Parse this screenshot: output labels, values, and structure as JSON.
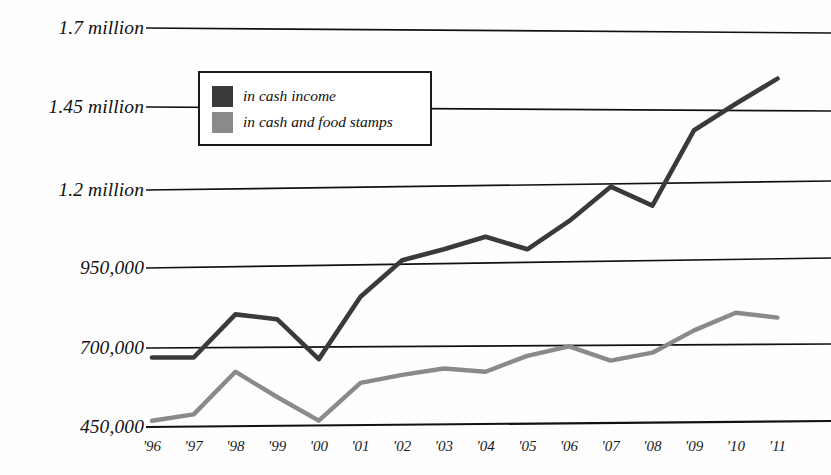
{
  "chart_data": {
    "type": "line",
    "title": "",
    "subtitle": "",
    "xlabel": "",
    "ylabel": "",
    "grid": true,
    "legend_position": "top-left-inside",
    "ylim": [
      450000,
      1700000
    ],
    "ytick_labels": [
      "1.7 million",
      "1.45 million",
      "1.2 million",
      "950,000",
      "700,000",
      "450,000"
    ],
    "ytick_values": [
      1700000,
      1450000,
      1200000,
      950000,
      700000,
      450000
    ],
    "categories": [
      "'96",
      "'97",
      "'98",
      "'99",
      "'00",
      "'01",
      "'02",
      "'03",
      "'04",
      "'05",
      "'06",
      "'07",
      "'08",
      "'09",
      "'10",
      "'11"
    ],
    "x": [
      "'96",
      "'97",
      "'98",
      "'99",
      "'00",
      "'01",
      "'02",
      "'03",
      "'04",
      "'05",
      "'06",
      "'07",
      "'08",
      "'09",
      "'10",
      "'11"
    ],
    "series": [
      {
        "name": "in cash income",
        "color": "#3a3a3a",
        "values": [
          670000,
          670000,
          805000,
          790000,
          665000,
          860000,
          975000,
          1010000,
          1050000,
          1010000,
          1100000,
          1210000,
          1150000,
          1380000,
          1460000,
          1540000
        ]
      },
      {
        "name": "in cash and food stamps",
        "color": "#8a8a8a",
        "values": [
          470000,
          490000,
          625000,
          545000,
          470000,
          590000,
          615000,
          635000,
          625000,
          675000,
          705000,
          660000,
          685000,
          755000,
          810000,
          795000
        ]
      }
    ]
  },
  "legend": {
    "items": [
      {
        "label": "in cash income",
        "color": "#3a3a3a"
      },
      {
        "label": "in cash and food stamps",
        "color": "#8a8a8a"
      }
    ]
  },
  "axis": {
    "y_labels": [
      "1.7 million",
      "1.45 million",
      "1.2 million",
      "950,000",
      "700,000",
      "450,000"
    ],
    "x_labels": [
      "'96",
      "'97",
      "'98",
      "'99",
      "'00",
      "'01",
      "'02",
      "'03",
      "'04",
      "'05",
      "'06",
      "'07",
      "'08",
      "'09",
      "'10",
      "'11"
    ]
  },
  "colors": {
    "series_dark": "#3a3a3a",
    "series_gray": "#8a8a8a",
    "gridline": "#111111",
    "background": "#ffffff",
    "text": "#111111"
  }
}
